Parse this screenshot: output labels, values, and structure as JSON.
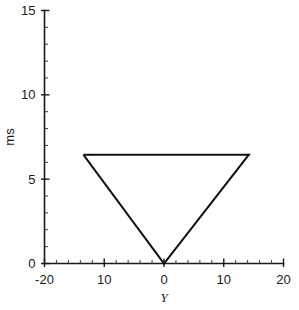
{
  "chart_data": {
    "type": "line",
    "title": "",
    "xlabel": "Y",
    "ylabel": "ms",
    "xlim": [
      -20,
      20
    ],
    "ylim": [
      0,
      15
    ],
    "grid": false,
    "legend": null,
    "x_ticks": [
      -20,
      -10,
      0,
      10,
      20
    ],
    "x_tick_labels": [
      "-20",
      "10",
      "0",
      "10",
      "20"
    ],
    "y_ticks": [
      0,
      5,
      10,
      15
    ],
    "y_tick_labels": [
      "0",
      "5",
      "10",
      "15"
    ],
    "x_minor_tick_step": 2,
    "y_minor_tick_step": 1,
    "series": [
      {
        "name": "triangle-outline",
        "closed": false,
        "x": [
          -13.5,
          14.2,
          0,
          -13.5
        ],
        "y": [
          6.45,
          6.45,
          0,
          6.45
        ]
      }
    ],
    "annotations": []
  },
  "axes": {
    "x_axis_name": "x-axis",
    "y_axis_name": "y-axis"
  }
}
